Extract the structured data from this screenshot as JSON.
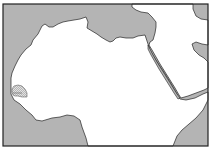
{
  "map": {
    "title": "Locator map of North Africa and the Middle East",
    "highlighted_region": "Senegal",
    "colors": {
      "sea": "#b4b4b4",
      "land": "#ffffff",
      "border": "#222222",
      "highlight_fill": "#d8d8d8"
    },
    "regions": [
      {
        "name": "Atlantic Ocean",
        "type": "sea"
      },
      {
        "name": "Mediterranean Sea",
        "type": "sea"
      },
      {
        "name": "Red Sea",
        "type": "sea"
      },
      {
        "name": "Gulf of Aden",
        "type": "sea"
      },
      {
        "name": "Persian Gulf",
        "type": "sea"
      },
      {
        "name": "Gulf of Guinea",
        "type": "sea"
      },
      {
        "name": "Africa",
        "type": "land"
      },
      {
        "name": "Arabian Peninsula",
        "type": "land"
      },
      {
        "name": "Senegal",
        "type": "highlight"
      }
    ]
  }
}
